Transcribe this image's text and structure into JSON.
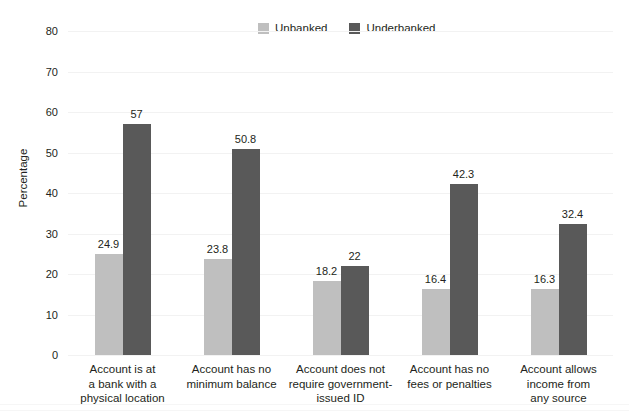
{
  "chart_data": {
    "type": "bar",
    "title": "",
    "xlabel": "",
    "ylabel": "Percentage",
    "ylim": [
      0,
      80
    ],
    "ytick_step": 10,
    "yticks": [
      "80",
      "70",
      "60",
      "50",
      "40",
      "30",
      "20",
      "10",
      "0"
    ],
    "grid": true,
    "legend_position": "top-center",
    "categories": [
      "Account is at a bank with a physical location",
      "Account has no minimum balance",
      "Account does not require government-issued ID",
      "Account has no fees or penalties",
      "Account allows income from any source"
    ],
    "category_lines": [
      [
        "Account is at",
        "a bank with a",
        "physical location"
      ],
      [
        "Account has no",
        "minimum balance"
      ],
      [
        "Account does not",
        "require government-",
        "issued ID"
      ],
      [
        "Account has no",
        "fees or penalties"
      ],
      [
        "Account allows",
        "income from",
        "any source"
      ]
    ],
    "series": [
      {
        "name": "Unbanked",
        "color": "#bfbfbf",
        "values": [
          24.9,
          23.8,
          18.2,
          16.4,
          16.3
        ],
        "labels": [
          "24.9",
          "23.8",
          "18.2",
          "16.4",
          "16.3"
        ]
      },
      {
        "name": "Underbanked",
        "color": "#595959",
        "values": [
          57,
          50.8,
          22,
          42.3,
          32.4
        ],
        "labels": [
          "57",
          "50.8",
          "22",
          "42.3",
          "32.4"
        ]
      }
    ]
  },
  "legend": {
    "items": [
      {
        "label": "Unbanked",
        "color": "#bfbfbf",
        "swatch": "legend-swatch-unbanked"
      },
      {
        "label": "Underbanked",
        "color": "#595959",
        "swatch": "legend-swatch-underbanked"
      }
    ]
  },
  "axis": {
    "y_title": "Percentage"
  }
}
